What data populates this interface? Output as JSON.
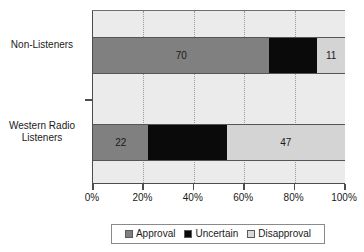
{
  "chart_data": {
    "type": "bar",
    "orientation": "horizontal",
    "stacked": true,
    "stack_mode": "percent",
    "title": "",
    "xlabel": "",
    "ylabel": "",
    "xlim": [
      0,
      100
    ],
    "grid": true,
    "legend_position": "bottom",
    "categories": [
      "Non-Listeners",
      "Western Radio Listeners"
    ],
    "category_label_lines": [
      [
        "Non-Listeners"
      ],
      [
        "Western Radio",
        "Listeners"
      ]
    ],
    "series": [
      {
        "name": "Approval",
        "color": "#808080",
        "values": [
          70,
          22
        ]
      },
      {
        "name": "Uncertain",
        "color": "#000000",
        "values": [
          19,
          31
        ]
      },
      {
        "name": "Disapproval",
        "color": "#d9d9d9",
        "values": [
          11,
          47
        ]
      }
    ],
    "bar_labels": [
      [
        {
          "series": "Approval",
          "value": 70,
          "text": "70",
          "shown": true
        },
        {
          "series": "Uncertain",
          "value": 19,
          "text": "19",
          "shown": false
        },
        {
          "series": "Disapproval",
          "value": 11,
          "text": "11",
          "shown": true
        }
      ],
      [
        {
          "series": "Approval",
          "value": 22,
          "text": "22",
          "shown": true
        },
        {
          "series": "Uncertain",
          "value": 31,
          "text": "31",
          "shown": false
        },
        {
          "series": "Disapproval",
          "value": 47,
          "text": "47",
          "shown": true
        }
      ]
    ],
    "xticks": [
      0,
      20,
      40,
      60,
      80,
      100
    ],
    "xtick_labels": [
      "0%",
      "20%",
      "40%",
      "60%",
      "80%",
      "100%"
    ],
    "legend_entries": [
      {
        "label": "Approval",
        "color": "#808080"
      },
      {
        "label": "Uncertain",
        "color": "#000000"
      },
      {
        "label": "Disapproval",
        "color": "#d9d9d9"
      }
    ],
    "plot_background": "#ebebeb",
    "page_background": "#ffffff"
  }
}
